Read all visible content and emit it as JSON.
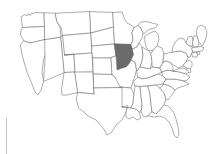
{
  "page": {
    "background_color": "#ffffff",
    "width": 214,
    "height": 154
  },
  "map": {
    "name": "united-states-outline-map",
    "projection_note": "contiguous united states",
    "border_color": "#6a6a6a",
    "default_fill": "#ffffff",
    "highlight_fill": "#6b6b6b",
    "highlighted_states": [
      "Iowa"
    ],
    "highlight_label": "Iowa",
    "state_count": 49,
    "states": [
      {
        "code": "WA",
        "name": "Washington",
        "highlighted": false
      },
      {
        "code": "OR",
        "name": "Oregon",
        "highlighted": false
      },
      {
        "code": "CA",
        "name": "California",
        "highlighted": false
      },
      {
        "code": "NV",
        "name": "Nevada",
        "highlighted": false
      },
      {
        "code": "ID",
        "name": "Idaho",
        "highlighted": false
      },
      {
        "code": "MT",
        "name": "Montana",
        "highlighted": false
      },
      {
        "code": "WY",
        "name": "Wyoming",
        "highlighted": false
      },
      {
        "code": "UT",
        "name": "Utah",
        "highlighted": false
      },
      {
        "code": "AZ",
        "name": "Arizona",
        "highlighted": false
      },
      {
        "code": "CO",
        "name": "Colorado",
        "highlighted": false
      },
      {
        "code": "NM",
        "name": "New Mexico",
        "highlighted": false
      },
      {
        "code": "ND",
        "name": "North Dakota",
        "highlighted": false
      },
      {
        "code": "SD",
        "name": "South Dakota",
        "highlighted": false
      },
      {
        "code": "NE",
        "name": "Nebraska",
        "highlighted": false
      },
      {
        "code": "KS",
        "name": "Kansas",
        "highlighted": false
      },
      {
        "code": "OK",
        "name": "Oklahoma",
        "highlighted": false
      },
      {
        "code": "TX",
        "name": "Texas",
        "highlighted": false
      },
      {
        "code": "MN",
        "name": "Minnesota",
        "highlighted": false
      },
      {
        "code": "IA",
        "name": "Iowa",
        "highlighted": true
      },
      {
        "code": "MO",
        "name": "Missouri",
        "highlighted": false
      },
      {
        "code": "AR",
        "name": "Arkansas",
        "highlighted": false
      },
      {
        "code": "LA",
        "name": "Louisiana",
        "highlighted": false
      },
      {
        "code": "WI",
        "name": "Wisconsin",
        "highlighted": false
      },
      {
        "code": "IL",
        "name": "Illinois",
        "highlighted": false
      },
      {
        "code": "MI",
        "name": "Michigan",
        "highlighted": false
      },
      {
        "code": "IN",
        "name": "Indiana",
        "highlighted": false
      },
      {
        "code": "OH",
        "name": "Ohio",
        "highlighted": false
      },
      {
        "code": "KY",
        "name": "Kentucky",
        "highlighted": false
      },
      {
        "code": "TN",
        "name": "Tennessee",
        "highlighted": false
      },
      {
        "code": "MS",
        "name": "Mississippi",
        "highlighted": false
      },
      {
        "code": "AL",
        "name": "Alabama",
        "highlighted": false
      },
      {
        "code": "GA",
        "name": "Georgia",
        "highlighted": false
      },
      {
        "code": "FL",
        "name": "Florida",
        "highlighted": false
      },
      {
        "code": "SC",
        "name": "South Carolina",
        "highlighted": false
      },
      {
        "code": "NC",
        "name": "North Carolina",
        "highlighted": false
      },
      {
        "code": "VA",
        "name": "Virginia",
        "highlighted": false
      },
      {
        "code": "WV",
        "name": "West Virginia",
        "highlighted": false
      },
      {
        "code": "MD",
        "name": "Maryland",
        "highlighted": false
      },
      {
        "code": "DE",
        "name": "Delaware",
        "highlighted": false
      },
      {
        "code": "PA",
        "name": "Pennsylvania",
        "highlighted": false
      },
      {
        "code": "NJ",
        "name": "New Jersey",
        "highlighted": false
      },
      {
        "code": "NY",
        "name": "New York",
        "highlighted": false
      },
      {
        "code": "CT",
        "name": "Connecticut",
        "highlighted": false
      },
      {
        "code": "RI",
        "name": "Rhode Island",
        "highlighted": false
      },
      {
        "code": "MA",
        "name": "Massachusetts",
        "highlighted": false
      },
      {
        "code": "VT",
        "name": "Vermont",
        "highlighted": false
      },
      {
        "code": "NH",
        "name": "New Hampshire",
        "highlighted": false
      },
      {
        "code": "ME",
        "name": "Maine",
        "highlighted": false
      }
    ]
  },
  "decoration": {
    "left_rule_color": "#c2c2c2"
  }
}
